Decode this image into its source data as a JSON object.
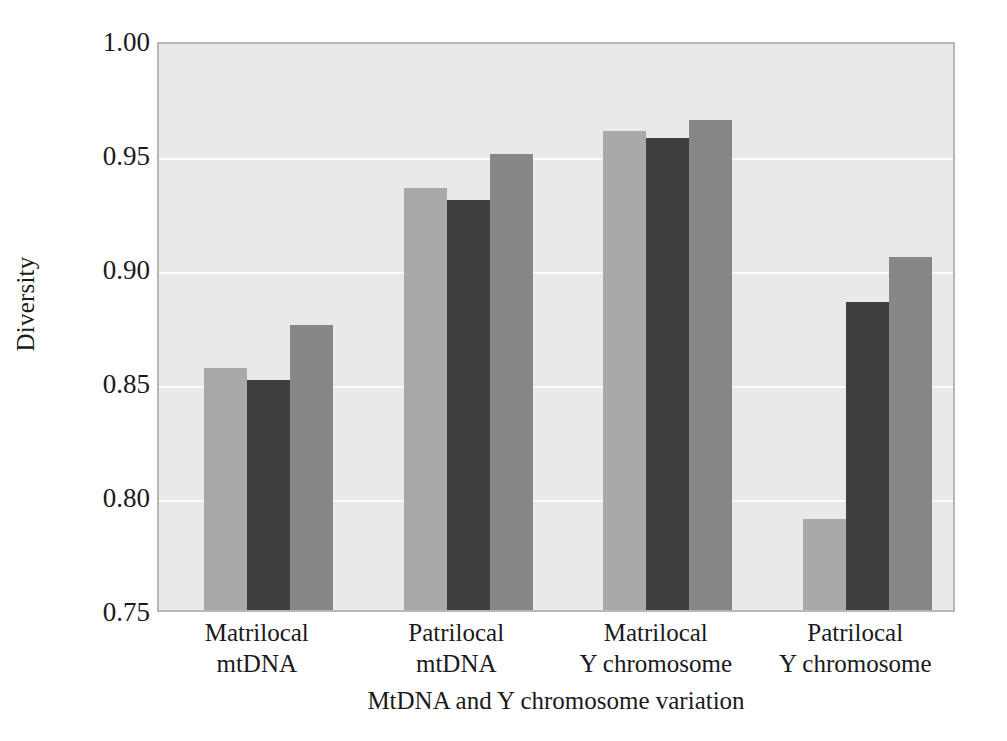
{
  "chart_data": {
    "type": "bar",
    "title": "",
    "subtitle": "",
    "xlabel": "MtDNA and Y chromosome variation",
    "ylabel": "Diversity",
    "ylim": [
      0.75,
      1.0
    ],
    "ytick_labels": [
      "1.00",
      "0.95",
      "0.90",
      "0.85",
      "0.80",
      "0.75"
    ],
    "ytick_values": [
      1.0,
      0.95,
      0.9,
      0.85,
      0.8,
      0.75
    ],
    "grid": true,
    "grid_axis": "y",
    "legend": false,
    "legend_position": "none",
    "categories": [
      "Matrilocal mtDNA",
      "Patrilocal mtDNA",
      "Matrilocal Y chromosome",
      "Patrilocal Y chromosome"
    ],
    "category_lines": [
      [
        "Matrilocal",
        "mtDNA"
      ],
      [
        "Patrilocal",
        "mtDNA"
      ],
      [
        "Matrilocal",
        "Y chromosome"
      ],
      [
        "Patrilocal",
        "Y chromosome"
      ]
    ],
    "series": [
      {
        "name": "series-1",
        "color": "#a9a9a9",
        "values": [
          0.856,
          0.935,
          0.96,
          0.79
        ]
      },
      {
        "name": "series-2",
        "color": "#3f3f3f",
        "values": [
          0.851,
          0.93,
          0.957,
          0.885
        ]
      },
      {
        "name": "series-3",
        "color": "#878787",
        "values": [
          0.875,
          0.95,
          0.965,
          0.905
        ]
      }
    ],
    "plot_background": "#e9e9e9",
    "plot_border_color": "#b7b7b7",
    "gridline_color": "#fbfbfb"
  }
}
